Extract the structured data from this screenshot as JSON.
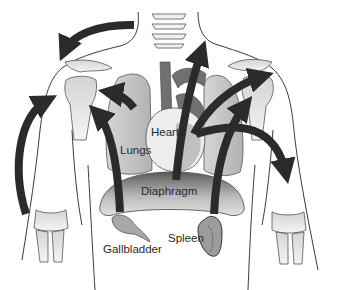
{
  "diagram": {
    "labels": {
      "heart": "Heart",
      "lungs": "Lungs",
      "diaphragm": "Diaphragm",
      "gallbladder": "Gallbladder",
      "spleen": "Spleen"
    },
    "colors": {
      "arrow": "#2b2b2b",
      "outline": "#3a3a3a",
      "organ_fill": "#c8c8c8",
      "organ_dark": "#6a6a6a",
      "bone_fill": "#e6e6e6",
      "background": "#ffffff"
    }
  }
}
